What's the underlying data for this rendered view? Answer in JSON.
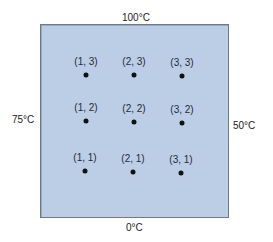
{
  "boundary_temperatures": {
    "top": "100°C",
    "left": "75°C",
    "right": "50°C",
    "bottom": "0°C"
  },
  "colors": {
    "plate_fill": "#bccee6",
    "plate_border": "#6f7a86",
    "node": "#111111"
  },
  "nodes": [
    {
      "label": "(1, 3)",
      "x": 86,
      "y": 75
    },
    {
      "label": "(2, 3)",
      "x": 134,
      "y": 75
    },
    {
      "label": "(3, 3)",
      "x": 182,
      "y": 76
    },
    {
      "label": "(1, 2)",
      "x": 86,
      "y": 121
    },
    {
      "label": "(2, 2)",
      "x": 134,
      "y": 122
    },
    {
      "label": "(3, 2)",
      "x": 182,
      "y": 123
    },
    {
      "label": "(1, 1)",
      "x": 85,
      "y": 171
    },
    {
      "label": "(2, 1)",
      "x": 133,
      "y": 172
    },
    {
      "label": "(3, 1)",
      "x": 181,
      "y": 173
    }
  ]
}
